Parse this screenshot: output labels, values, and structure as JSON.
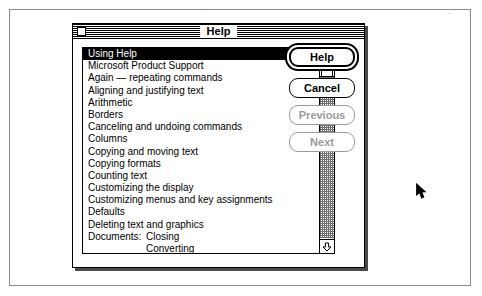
{
  "window": {
    "title": "Help",
    "close_box": "close-box"
  },
  "list": {
    "selected_index": 0,
    "items": [
      {
        "label": "Using Help"
      },
      {
        "label": "Microsoft Product Support"
      },
      {
        "label": "Again — repeating commands"
      },
      {
        "label": "Aligning and justifying text"
      },
      {
        "label": "Arithmetic"
      },
      {
        "label": "Borders"
      },
      {
        "label": "Canceling and undoing commands"
      },
      {
        "label": "Columns"
      },
      {
        "label": "Copying and moving text"
      },
      {
        "label": "Copying formats"
      },
      {
        "label": "Counting text"
      },
      {
        "label": "Customizing the display"
      },
      {
        "label": "Customizing menus and key assignments"
      },
      {
        "label": "Defaults"
      },
      {
        "label": "Deleting text and graphics"
      },
      {
        "group": "Documents:",
        "label": "Closing"
      },
      {
        "sub": true,
        "label": "Converting"
      },
      {
        "sub": true,
        "label": "Creating"
      }
    ]
  },
  "scrollbar": {
    "up_arrow": "scroll-up-arrow",
    "down_arrow": "scroll-down-arrow",
    "thumb": "scroll-thumb"
  },
  "buttons": [
    {
      "label": "Help",
      "state": "default"
    },
    {
      "label": "Cancel",
      "state": "enabled"
    },
    {
      "label": "Previous",
      "state": "disabled"
    },
    {
      "label": "Next",
      "state": "disabled"
    }
  ],
  "artifact": {
    "text": "..."
  }
}
